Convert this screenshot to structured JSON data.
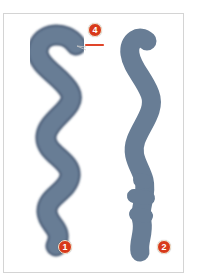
{
  "figure": {
    "colors": {
      "stroke_fill": "#687d95",
      "stroke_edge": "#4d5f78",
      "badge_fill": "#d8391a",
      "badge_ring": "#f6e9d2",
      "pointer_line": "#e0452a",
      "frame_border": "#d4d4d4"
    },
    "strokes": [
      {
        "id": "soft-wavy-stroke",
        "edge": "soft"
      },
      {
        "id": "hard-irregular-stroke",
        "edge": "hard"
      }
    ],
    "callouts": [
      {
        "label": "1",
        "refers_to": "soft-wavy-stroke end"
      },
      {
        "label": "2",
        "refers_to": "hard-irregular-stroke end"
      },
      {
        "label": "4",
        "refers_to": "soft-wavy-stroke top edge"
      }
    ]
  }
}
